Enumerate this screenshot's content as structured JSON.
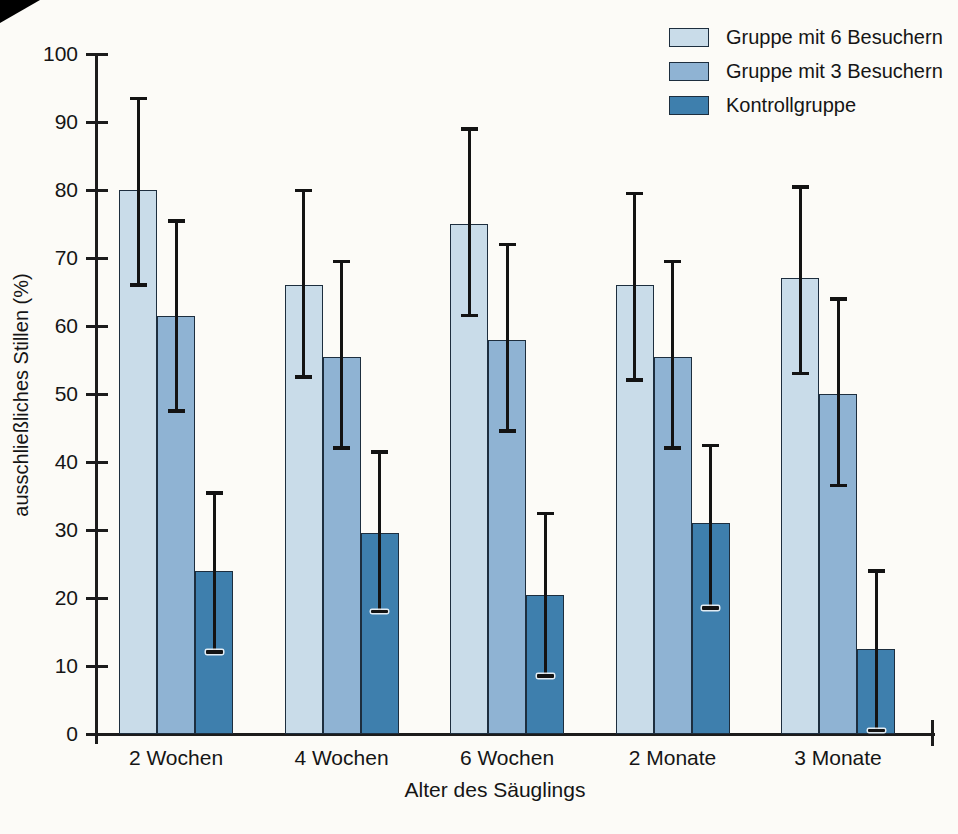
{
  "chart_data": {
    "type": "bar",
    "title": "",
    "xlabel": "Alter des Säuglings",
    "ylabel": "ausschließliches Stillen (%)",
    "ylim": [
      0,
      100
    ],
    "yticks": [
      0,
      10,
      20,
      30,
      40,
      50,
      60,
      70,
      80,
      90,
      100
    ],
    "grid": false,
    "legend_position": "top-right",
    "categories": [
      "2 Wochen",
      "4 Wochen",
      "6 Wochen",
      "2 Monate",
      "3 Monate"
    ],
    "series": [
      {
        "name": "Gruppe mit 6 Besuchern",
        "color": "#c9dce9",
        "values": [
          80,
          66,
          75,
          66,
          67
        ],
        "err_low": [
          66,
          52.5,
          61.5,
          52,
          53
        ],
        "err_high": [
          93.5,
          80,
          89,
          79.5,
          80.5
        ]
      },
      {
        "name": "Gruppe mit 3 Besuchern",
        "color": "#8fb3d3",
        "values": [
          61.5,
          55.5,
          58,
          55.5,
          50
        ],
        "err_low": [
          47.5,
          42,
          44.5,
          42,
          36.5
        ],
        "err_high": [
          75.5,
          69.5,
          72,
          69.5,
          64
        ]
      },
      {
        "name": "Kontrollgruppe",
        "color": "#3e7fad",
        "values": [
          24,
          29.5,
          20.5,
          31,
          12.5
        ],
        "err_low": [
          12,
          18,
          8.5,
          18.5,
          0.5
        ],
        "err_high": [
          35.5,
          41.5,
          32.5,
          42.5,
          24
        ]
      }
    ]
  }
}
